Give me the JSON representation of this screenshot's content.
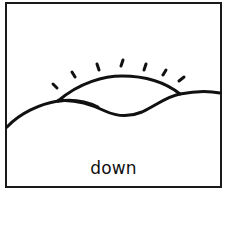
{
  "card": {
    "caption": "down",
    "subject": "sun setting behind hills",
    "colors": {
      "line": "#111111",
      "background": "#ffffff",
      "border": "#1a1a1a"
    },
    "rays_count": 7
  }
}
